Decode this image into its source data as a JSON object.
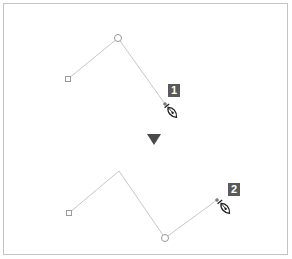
{
  "diagram": {
    "colors": {
      "path": "#c8c8c8",
      "anchor": "#9a9a9a",
      "badge_bg": "#5a5a5a",
      "badge_text": "#ffffff",
      "arrow": "#4a4a4a",
      "frame": "#c4c4c4"
    },
    "steps": [
      {
        "label": "1",
        "points": [
          [
            68,
            79
          ],
          [
            118,
            38
          ],
          [
            165,
            104
          ]
        ],
        "square_anchor": [
          68,
          79
        ],
        "circle_anchor": [
          118,
          38
        ],
        "cursor": [
          172,
          112
        ],
        "badge": [
          168,
          84
        ]
      },
      {
        "label": "2",
        "points": [
          [
            69,
            213
          ],
          [
            119,
            171
          ],
          [
            165,
            238
          ],
          [
            217,
            200
          ]
        ],
        "square_anchor": [
          69,
          213
        ],
        "circle_anchor": [
          165,
          238
        ],
        "cursor": [
          225,
          208
        ],
        "badge": [
          228,
          183
        ]
      }
    ],
    "arrow": {
      "direction": "down",
      "center": [
        154,
        139
      ]
    }
  }
}
